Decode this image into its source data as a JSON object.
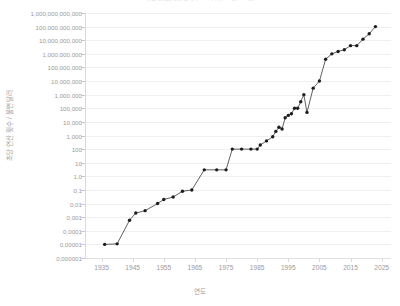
{
  "chart_data": {
    "type": "line",
    "title": "1950년 이후 컴퓨팅 성능의 증가",
    "xlabel": "연도",
    "ylabel": "초당 연산 횟수 / 불변 달러",
    "yscale": "log",
    "grid": true,
    "legend": "none",
    "marker": "circle",
    "series_color": "#1d1d1d",
    "grid_color": "#efeff1",
    "axis_color": "#d9d9dc",
    "tick_text_color": "#9b9b9f",
    "xlim": [
      1930,
      2028
    ],
    "ylim": [
      1e-06,
      1000000000000.0
    ],
    "xticks": [
      "1935",
      "1945",
      "1955",
      "1965",
      "1975",
      "1985",
      "1995",
      "2005",
      "2015",
      "2025"
    ],
    "xtick_values": [
      1935,
      1945,
      1955,
      1965,
      1975,
      1985,
      1995,
      2005,
      2015,
      2025
    ],
    "yticks": [
      "1,000,000,000,000",
      "100,000,000,000",
      "10,000,000,000",
      "1,000,000,000",
      "100,000,000",
      "10,000,000",
      "1,000,000",
      "100,000",
      "10,000",
      "1,000",
      "100",
      "10",
      "1,0",
      "0,1",
      "0,01",
      "0,001",
      "0,0001",
      "0,00001",
      "0,000001"
    ],
    "ytick_values": [
      1000000000000.0,
      100000000000.0,
      10000000000.0,
      1000000000.0,
      100000000.0,
      10000000.0,
      1000000.0,
      100000.0,
      10000.0,
      1000.0,
      100.0,
      10.0,
      1,
      0.1,
      0.01,
      0.001,
      0.0001,
      1e-05,
      1e-06
    ],
    "series": [
      {
        "name": "초당 연산 횟수 / 불변 달러",
        "x": [
          1936,
          1940,
          1944,
          1946,
          1949,
          1953,
          1955,
          1958,
          1961,
          1964,
          1968,
          1972,
          1975,
          1977,
          1980,
          1983,
          1985,
          1986,
          1988,
          1990,
          1991,
          1992,
          1993,
          1994,
          1995,
          1996,
          1997,
          1998,
          1999,
          2000,
          2001,
          2003,
          2005,
          2007,
          2009,
          2011,
          2013,
          2015,
          2017,
          2019,
          2021,
          2023
        ],
        "y": [
          1e-05,
          1.1e-05,
          0.0006,
          0.002,
          0.003,
          0.01,
          0.02,
          0.03,
          0.08,
          0.1,
          3.0,
          3.0,
          3.0,
          100.0,
          100.0,
          100.0,
          100.0,
          200.0,
          400.0,
          800.0,
          2000.0,
          4000.0,
          3000.0,
          20000.0,
          30000.0,
          40000.0,
          100000.0,
          100000.0,
          300000.0,
          1000000.0,
          50000.0,
          3000000.0,
          10000000.0,
          400000000.0,
          1000000000.0,
          1500000000.0,
          2000000000.0,
          4000000000.0,
          4000000000.0,
          12000000000.0,
          30000000000.0,
          100000000000.0
        ]
      }
    ]
  }
}
